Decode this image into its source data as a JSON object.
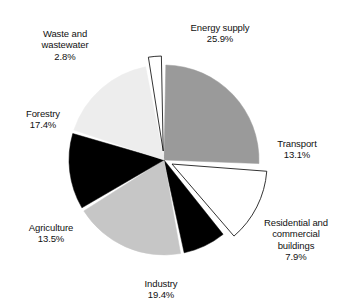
{
  "chart_data": {
    "type": "pie",
    "title": "",
    "categories": [
      "Energy supply",
      "Transport",
      "Residential and commercial buildings",
      "Industry",
      "Agriculture",
      "Forestry",
      "Waste and wastewater"
    ],
    "values": [
      25.9,
      13.1,
      7.9,
      19.4,
      13.5,
      17.4,
      2.8
    ],
    "unit": "%",
    "legend": "none",
    "labels_position": "outside",
    "grid": false,
    "start_angle_deg": 0,
    "direction": "clockwise",
    "slice_colors": [
      "#9a9a9a",
      "#ffffff",
      "#000000",
      "#c6c6c6",
      "#000000",
      "#ededed",
      "#ffffff"
    ],
    "exploded": [
      false,
      true,
      false,
      false,
      false,
      false,
      true
    ]
  },
  "slices": [
    {
      "key": "energy-supply",
      "name": "Energy supply",
      "percent": "25.9%",
      "color": "#9a9a9a"
    },
    {
      "key": "transport",
      "name": "Transport",
      "percent": "13.1%",
      "color": "#ffffff"
    },
    {
      "key": "residential-commercial-buildings",
      "name": "Residential and\ncommercial\nbuildings",
      "percent": "7.9%",
      "color": "#000000"
    },
    {
      "key": "industry",
      "name": "Industry",
      "percent": "19.4%",
      "color": "#c6c6c6"
    },
    {
      "key": "agriculture",
      "name": "Agriculture",
      "percent": "13.5%",
      "color": "#000000"
    },
    {
      "key": "forestry",
      "name": "Forestry",
      "percent": "17.4%",
      "color": "#ededed"
    },
    {
      "key": "waste-and-wastewater",
      "name": "Waste and\nwastewater",
      "percent": "2.8%",
      "color": "#ffffff"
    }
  ]
}
